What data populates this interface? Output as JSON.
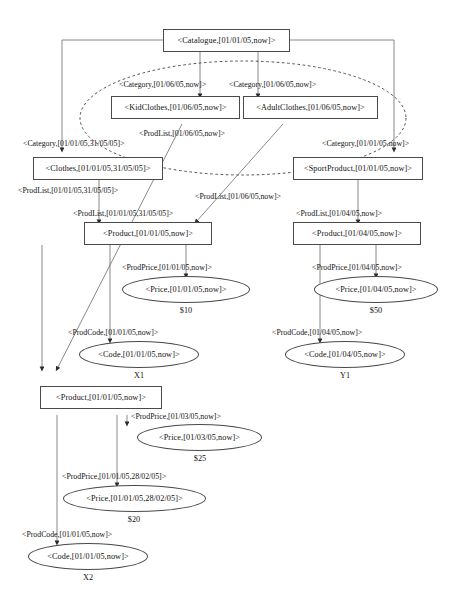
{
  "diagram": {
    "nodes": {
      "catalogue": {
        "label": "<Catalogue,[01/01/05,now]>"
      },
      "kidclothes": {
        "label": "<KidClothes,[01/06/05,now]>"
      },
      "adultclothes": {
        "label": "<AdultClothes,[01/06/05,now]>"
      },
      "clothes": {
        "label": "<Clothes,[01/01/05,31/05/05]>"
      },
      "sportproduct": {
        "label": "<SportProduct,[01/01/05,now]>"
      },
      "product_left": {
        "label": "<Product,[01/01/05,now]>"
      },
      "product_right": {
        "label": "<Product,[01/04/05,now]>"
      },
      "price_left": {
        "label": "<Price,[01/01/05,now]>"
      },
      "price_right": {
        "label": "<Price,[01/04/05,now]>"
      },
      "code_left": {
        "label": "<Code,[01/01/05,now]>"
      },
      "code_right": {
        "label": "<Code,[01/04/05,now]>"
      },
      "product_bottom": {
        "label": "<Product,[01/01/05,now]>"
      },
      "price_b1": {
        "label": "<Price,[01/03/05,now]>"
      },
      "price_b2": {
        "label": "<Price,[01/01/05,28/02/05]>"
      },
      "code_bottom": {
        "label": "<Code,[01/01/05,now]>"
      }
    },
    "edge_labels": {
      "category_kid": "<Category,[01/06/05,now]>",
      "category_adult": "<Category,[01/06/05,now]>",
      "category_clothes": "<Category,[01/01/05,31/05/05]>",
      "category_sport": "<Category,[01/01/05,now]>",
      "prodlist_kid_top": "<ProdList,[01/06/05,now]>",
      "prodlist_clothes_up": "<ProdList,[01/01/05,31/05/05]>",
      "prodlist_adult_mid": "<ProdList,[01/06/05,now]>",
      "prodlist_left": "<ProdList,[01/01/05,31/05/05]>",
      "prodlist_right": "<ProdList,[01/04/05,now]>",
      "prodprice_left": "<ProdPrice,[01/01/05,now]>",
      "prodprice_right": "<ProdPrice,[01/04/05,now]>",
      "prodcode_left": "<ProdCode,[01/01/05,now]>",
      "prodcode_right": "<ProdCode,[01/04/05,now]>",
      "prodprice_b1": "<ProdPrice,[01/03/05,now]>",
      "prodprice_b2": "<ProdPrice,[01/01/05,28/02/05]>",
      "prodcode_bottom": "<ProdCode,[01/01/05,now]>"
    },
    "values": {
      "price_left_value": "$10",
      "price_right_value": "$50",
      "code_left_value": "X1",
      "code_right_value": "Y1",
      "price_b1_value": "$25",
      "price_b2_value": "$20",
      "code_bottom_value": "X2"
    },
    "colors": {
      "stroke": "#4a4a4a",
      "text": "#111111",
      "background": "#ffffff"
    }
  }
}
